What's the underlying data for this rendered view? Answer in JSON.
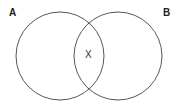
{
  "diagram": {
    "type": "venn",
    "sets": [
      {
        "label": "A",
        "cx": 60,
        "cy": 56,
        "r": 44
      },
      {
        "label": "B",
        "cx": 118,
        "cy": 56,
        "r": 44
      }
    ],
    "intersection_label": "X",
    "stroke_color": "#555555"
  }
}
